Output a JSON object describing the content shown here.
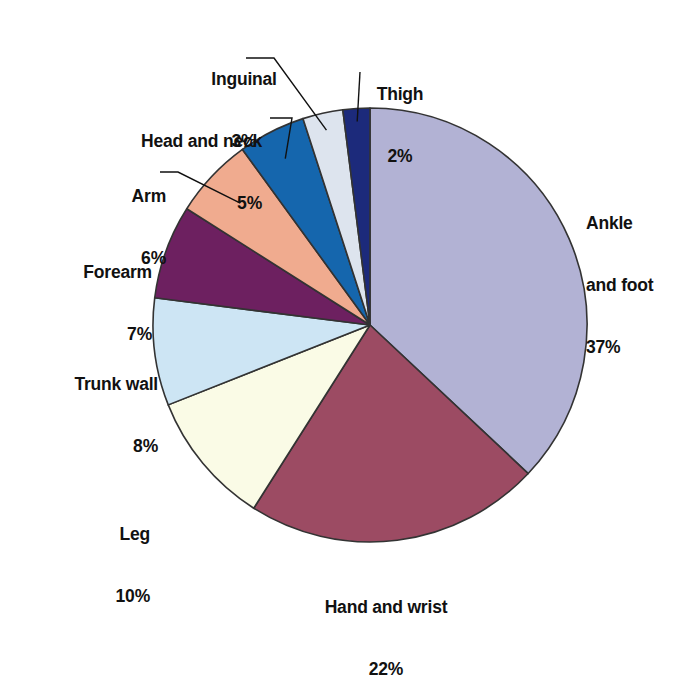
{
  "chart_data": {
    "type": "pie",
    "title": "",
    "subtitle": "",
    "xlabel": "",
    "ylabel": "",
    "legend_position": "none",
    "grid": false,
    "unit": "%",
    "total": 100,
    "start_angle_deg": 0,
    "direction": "clockwise",
    "categories": [
      "Ankle and foot",
      "Hand and wrist",
      "Leg",
      "Trunk wall",
      "Forearm",
      "Arm",
      "Head and neck",
      "Inguinal",
      "Thigh"
    ],
    "values": [
      37,
      22,
      10,
      8,
      7,
      6,
      5,
      3,
      2
    ],
    "slices": [
      {
        "label": "Ankle and foot",
        "label_line1": "Ankle",
        "label_line2": "and foot",
        "value": 37,
        "percent_text": "37%",
        "color": "#b2b2d4",
        "leader": false
      },
      {
        "label": "Hand and wrist",
        "label_line1": "Hand and wrist",
        "label_line2": "",
        "value": 22,
        "percent_text": "22%",
        "color": "#9c4b63",
        "leader": false
      },
      {
        "label": "Leg",
        "label_line1": "Leg",
        "label_line2": "",
        "value": 10,
        "percent_text": "10%",
        "color": "#fafbe6",
        "leader": false
      },
      {
        "label": "Trunk wall",
        "label_line1": "Trunk wall",
        "label_line2": "",
        "value": 8,
        "percent_text": "8%",
        "color": "#cde5f4",
        "leader": false
      },
      {
        "label": "Forearm",
        "label_line1": "Forearm",
        "label_line2": "",
        "value": 7,
        "percent_text": "7%",
        "color": "#6d2060",
        "leader": false
      },
      {
        "label": "Arm",
        "label_line1": "Arm",
        "label_line2": "",
        "value": 6,
        "percent_text": "6%",
        "color": "#f0ab8f",
        "leader": true
      },
      {
        "label": "Head and neck",
        "label_line1": "Head and neck",
        "label_line2": "",
        "value": 5,
        "percent_text": "5%",
        "color": "#1566ad",
        "leader": true
      },
      {
        "label": "Inguinal",
        "label_line1": "Inguinal",
        "label_line2": "",
        "value": 3,
        "percent_text": "3%",
        "color": "#dde4ee",
        "leader": true
      },
      {
        "label": "Thigh",
        "label_line1": "Thigh",
        "label_line2": "",
        "value": 2,
        "percent_text": "2%",
        "color": "#1c2a7b",
        "leader": true
      }
    ],
    "geometry": {
      "center_x": 370,
      "center_y": 325,
      "radius": 217,
      "outline_color": "#333333"
    }
  },
  "caption": {
    "text": ""
  }
}
